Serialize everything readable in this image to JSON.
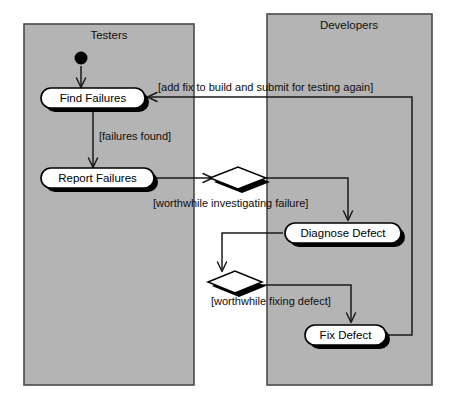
{
  "diagram": {
    "type": "uml-activity-diagram",
    "canvas": {
      "width": 451,
      "height": 410,
      "background": "#ffffff"
    },
    "colors": {
      "lane_fill": "#b4b4b4",
      "lane_border": "#4a4a4a",
      "node_fill": "#ffffff",
      "node_border": "#000000",
      "shadow": "#000000",
      "edge": "#1a1a1a",
      "text": "#000000"
    },
    "swimlanes": [
      {
        "id": "testers",
        "title": "Testers",
        "x": 24,
        "y": 24,
        "width": 170,
        "height": 361,
        "title_x": 109,
        "title_y": 36
      },
      {
        "id": "developers",
        "title": "Developers",
        "x": 267,
        "y": 14,
        "width": 165,
        "height": 371,
        "title_x": 349,
        "title_y": 26
      }
    ],
    "initial_node": {
      "id": "start",
      "label": "initial-node",
      "cx": 81,
      "cy": 58,
      "r": 6.5
    },
    "actions": [
      {
        "id": "find-failures",
        "label": "Find Failures",
        "x": 41,
        "y": 88,
        "width": 104,
        "height": 20,
        "rx": 10,
        "lane": "testers"
      },
      {
        "id": "report-failures",
        "label": "Report Failures",
        "x": 41,
        "y": 168,
        "width": 113,
        "height": 20,
        "rx": 10,
        "lane": "testers"
      },
      {
        "id": "diagnose-defect",
        "label": "Diagnose Defect",
        "x": 285,
        "y": 223,
        "width": 116,
        "height": 20,
        "rx": 10,
        "lane": "developers"
      },
      {
        "id": "fix-defect",
        "label": "Fix Defect",
        "x": 305,
        "y": 325,
        "width": 81,
        "height": 20,
        "rx": 10,
        "lane": "developers"
      }
    ],
    "decisions": [
      {
        "id": "decision-investigate",
        "label": "decision-node-investigate-failure",
        "cx": 238,
        "cy": 178,
        "rx": 28,
        "ry": 11
      },
      {
        "id": "decision-fix",
        "label": "decision-node-fix-defect",
        "cx": 235,
        "cy": 282,
        "rx": 27,
        "ry": 11
      }
    ],
    "guards": [
      {
        "id": "guard-add-fix",
        "text": "[add fix to build and submit for testing again]",
        "x": 158,
        "y": 88,
        "anchor": "start"
      },
      {
        "id": "guard-failures-found",
        "text": "[failures found]",
        "x": 99,
        "y": 137,
        "anchor": "start"
      },
      {
        "id": "guard-worthwhile-investigating",
        "text": "[worthwhile investigating failure]",
        "x": 153,
        "y": 204,
        "anchor": "start"
      },
      {
        "id": "guard-worthwhile-fixing",
        "text": "[worthwhile fixing defect]",
        "x": 211,
        "y": 302,
        "anchor": "start"
      }
    ],
    "edges": [
      {
        "id": "edge-start-to-find-failures",
        "from": "start",
        "to": "find-failures",
        "path": "M 81 66 L 81 86",
        "arrow": "M 76.5 78 L 81 87.5 L 85.5 78"
      },
      {
        "id": "edge-find-to-report-failures",
        "from": "find-failures",
        "to": "report-failures",
        "guard": "guard-failures-found",
        "path": "M 93 110 L 93 166",
        "arrow": "M 88.5 158 L 93 167.5 L 97.5 158"
      },
      {
        "id": "edge-report-failures-to-decision",
        "from": "report-failures",
        "to": "decision-investigate",
        "path": "M 156 178 L 212 178",
        "arrow": "M 203 173.5 L 212.5 178 L 203 182.5"
      },
      {
        "id": "edge-decision-to-diagnose",
        "from": "decision-investigate",
        "to": "diagnose-defect",
        "guard": "guard-worthwhile-investigating",
        "path": "M 266 178 L 348 178 L 348 219",
        "arrow": "M 343.5 211 L 348 220.5 L 352.5 211"
      },
      {
        "id": "edge-diagnose-to-decision-fix",
        "from": "diagnose-defect",
        "to": "decision-fix",
        "path": "M 283 233 L 222 233 L 222 270",
        "arrow": "M 217.5 262 L 222 271.5 L 226.5 262"
      },
      {
        "id": "edge-decision-fix-to-fix-defect",
        "from": "decision-fix",
        "to": "fix-defect",
        "guard": "guard-worthwhile-fixing",
        "path": "M 262 285 L 351 285 L 351 321",
        "arrow": "M 346.5 313 L 351 322.5 L 355.5 313"
      },
      {
        "id": "edge-fix-defect-to-find-failures",
        "from": "fix-defect",
        "to": "find-failures",
        "guard": "guard-add-fix",
        "path": "M 388 335 L 412 335 L 412 97 L 148 97",
        "arrow": "M 157 92.5 L 147.5 97 L 157 101.5"
      }
    ]
  }
}
